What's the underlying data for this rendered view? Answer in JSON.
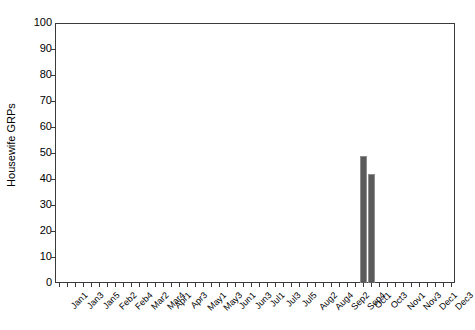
{
  "chart_data": {
    "type": "bar",
    "title": "",
    "xlabel": "",
    "ylabel": "Housewife GRPs",
    "ylim": [
      0,
      100
    ],
    "ytick_values": [
      0,
      10,
      20,
      30,
      40,
      50,
      60,
      70,
      80,
      90,
      100
    ],
    "ytick_labels": [
      "0",
      "10",
      "20",
      "30",
      "40",
      "50",
      "60",
      "70",
      "80",
      "90",
      "100"
    ],
    "grid": false,
    "legend": "none",
    "categories": [
      "Jan1",
      "Jan2",
      "Jan3",
      "Jan4",
      "Jan5",
      "Feb1",
      "Feb2",
      "Feb3",
      "Feb4",
      "Mar1",
      "Mar2",
      "Mar3",
      "Mar4",
      "Apr1",
      "Apr2",
      "Apr3",
      "Apr4",
      "May1",
      "May2",
      "May3",
      "May4",
      "Jun1",
      "Jun2",
      "Jun3",
      "Jun4",
      "Jul1",
      "Jul2",
      "Jul3",
      "Jul4",
      "Jul5",
      "Aug1",
      "Aug2",
      "Aug3",
      "Aug4",
      "Sep1",
      "Sep2",
      "Sep3",
      "Sep4",
      "Oct1",
      "Oct2",
      "Oct3",
      "Oct4",
      "Nov1",
      "Nov2",
      "Nov3",
      "Nov4",
      "Dec1",
      "Dec2",
      "Dec3",
      "Dec4"
    ],
    "visible_tick_labels": [
      "Jan1",
      "Jan3",
      "Jan5",
      "Feb2",
      "Feb4",
      "Mar2",
      "Mar4",
      "Apr1",
      "Apr3",
      "May1",
      "May3",
      "Jun1",
      "Jun3",
      "Jul1",
      "Jul3",
      "Jul5",
      "Aug2",
      "Aug4",
      "Sep2",
      "Sep4",
      "Oct1",
      "Oct3",
      "Nov1",
      "Nov3",
      "Dec1",
      "Dec3"
    ],
    "values": [
      0,
      0,
      0,
      0,
      0,
      0,
      0,
      0,
      0,
      0,
      0,
      0,
      0,
      0,
      0,
      0,
      0,
      0,
      0,
      0,
      0,
      0,
      0,
      0,
      0,
      0,
      0,
      0,
      0,
      0,
      0,
      0,
      0,
      0,
      0,
      0,
      0,
      0,
      49,
      42,
      0,
      0,
      0,
      0,
      0,
      0,
      0,
      0,
      0,
      0
    ],
    "nonzero_points": [
      {
        "category": "Oct1",
        "value": 49
      },
      {
        "category": "Oct2",
        "value": 42
      }
    ],
    "colors": {
      "bar_fill": "#5a5a5a",
      "bar_edge": "#8d8d8d",
      "axis": "#3a3a3a",
      "background": "#ffffff",
      "text": "#000000"
    }
  }
}
